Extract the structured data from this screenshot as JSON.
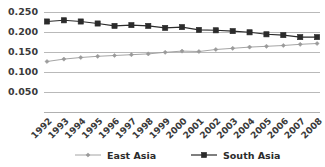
{
  "chart_data": {
    "type": "line",
    "title": "",
    "subtitle": "",
    "xlabel": "",
    "ylabel": "",
    "grid": true,
    "legend_position": "bottom",
    "ylim": [
      0.0,
      0.25
    ],
    "yticks": [
      "0.050",
      "0.100",
      "0.150",
      "0.200",
      "0.250"
    ],
    "ytick_values": [
      0.05,
      0.1,
      0.15,
      0.2,
      0.25
    ],
    "categories": [
      "1992",
      "1993",
      "1994",
      "1995",
      "1996",
      "1997",
      "1998",
      "1999",
      "2000",
      "2001",
      "2002",
      "2003",
      "2004",
      "2005",
      "2006",
      "2007",
      "2008"
    ],
    "series": [
      {
        "name": "East Asia",
        "color": "#9a9a9a",
        "marker": "diamond",
        "values": [
          0.125,
          0.131,
          0.135,
          0.138,
          0.14,
          0.142,
          0.144,
          0.148,
          0.151,
          0.15,
          0.155,
          0.158,
          0.161,
          0.163,
          0.165,
          0.168,
          0.17
        ]
      },
      {
        "name": "South Asia",
        "color": "#2b2b2b",
        "marker": "square",
        "values": [
          0.225,
          0.228,
          0.225,
          0.22,
          0.214,
          0.216,
          0.214,
          0.209,
          0.211,
          0.204,
          0.203,
          0.201,
          0.198,
          0.193,
          0.191,
          0.186,
          0.186
        ]
      }
    ]
  },
  "legend": {
    "items": [
      {
        "label": "East Asia",
        "color": "#9a9a9a",
        "marker": "diamond"
      },
      {
        "label": "South Asia",
        "color": "#2b2b2b",
        "marker": "square"
      }
    ]
  },
  "colors": {
    "background": "#ffffff",
    "grid": "#b9b9b9",
    "axis": "#b0b0b0",
    "text": "#2b2b2b",
    "east_asia": "#9a9a9a",
    "south_asia": "#2b2b2b"
  }
}
